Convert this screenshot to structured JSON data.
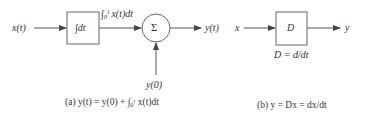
{
  "diagram_a": {
    "input_label": "x(t)",
    "integrator_label": "∫dt",
    "integral_label": "∫₀ᵗ x(t)dt",
    "sum_symbol": "Σ",
    "output_label": "y(t)",
    "initial_label": "y(0)",
    "caption": "(a) y(t) = y(0) + ∫₀ᵗ x(t)dt"
  },
  "diagram_b": {
    "input_label": "x",
    "block_label": "D",
    "output_label": "y",
    "operator_def": "D = d/dt",
    "caption": "(b) y = Dx = dx/dt"
  },
  "colors": {
    "stroke": "#555555",
    "text": "#333333"
  }
}
